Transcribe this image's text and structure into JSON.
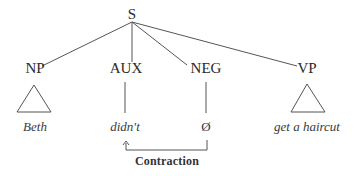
{
  "tree": {
    "root": {
      "label": "S"
    },
    "children": [
      {
        "label": "NP",
        "leaf": "Beth",
        "leaf_type": "triangle"
      },
      {
        "label": "AUX",
        "leaf": "didn't",
        "leaf_type": "line"
      },
      {
        "label": "NEG",
        "leaf": "Ø",
        "leaf_type": "line"
      },
      {
        "label": "VP",
        "leaf": "get a haircut",
        "leaf_type": "triangle"
      }
    ]
  },
  "movement": {
    "label": "Contraction",
    "from": "NEG",
    "to": "AUX",
    "arrow_glyph": "↑"
  },
  "colors": {
    "line": "#555555",
    "text": "#2a2a2a"
  }
}
